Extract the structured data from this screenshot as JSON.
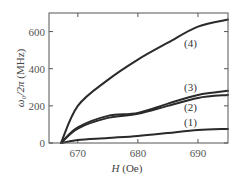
{
  "chart_data": {
    "type": "line",
    "title": "",
    "xlabel": "H (Oe)",
    "ylabel": "ω₀/2π (MHz)",
    "xlim": [
      665.2,
      695
    ],
    "ylim": [
      0,
      700
    ],
    "xticks": [
      670,
      680,
      690
    ],
    "yticks": [
      0,
      200,
      400,
      600
    ],
    "grid": false,
    "legend": "inline labels",
    "series": [
      {
        "name": "(1)",
        "x": [
          667.2,
          670,
          675,
          680,
          685,
          690,
          695
        ],
        "y": [
          0,
          16,
          27,
          38,
          54,
          70,
          76
        ]
      },
      {
        "name": "(2)",
        "x": [
          667.2,
          670,
          675,
          680,
          685,
          690,
          695
        ],
        "y": [
          0,
          78,
          135,
          157,
          200,
          243,
          259
        ]
      },
      {
        "name": "(3)",
        "x": [
          667.2,
          670,
          675,
          680,
          685,
          690,
          695
        ],
        "y": [
          0,
          84,
          146,
          162,
          212,
          259,
          281
        ]
      },
      {
        "name": "(4)",
        "x": [
          667.2,
          670,
          675,
          680,
          685,
          690,
          695
        ],
        "y": [
          0,
          200,
          340,
          449,
          540,
          627,
          665
        ]
      }
    ]
  },
  "labels": {
    "xlabel_italic": "H",
    "xlabel_unit": " (Oe)",
    "ylabel_symbol": "ω₀/2π",
    "ylabel_unit": " (MHz)",
    "curve_1": "(1)",
    "curve_2": "(2)",
    "curve_3": "(3)",
    "curve_4": "(4)"
  }
}
